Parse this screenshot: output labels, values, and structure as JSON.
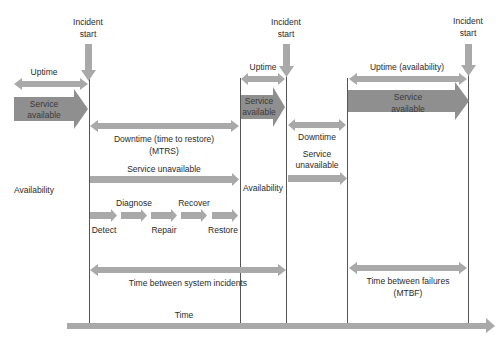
{
  "diagram": {
    "type": "timeline",
    "colors": {
      "arrow_light": "#a9a9a9",
      "arrow_dark": "#8f8f8f",
      "line": "#555555",
      "text": "#2a2a2a"
    },
    "incidents": [
      {
        "label_line1": "Incident",
        "label_line2": "start"
      },
      {
        "label_line1": "Incident",
        "label_line2": "start"
      },
      {
        "label_line1": "Incident",
        "label_line2": "start"
      }
    ],
    "phase1": {
      "uptime": "Uptime",
      "service_available_line1": "Service",
      "service_available_line2": "available",
      "downtime_line1": "Downtime (time to restore)",
      "downtime_line2": "(MTRS)",
      "service_unavailable": "Service unavailable",
      "availability": "Availability",
      "steps": [
        {
          "label": "Detect"
        },
        {
          "label": "Diagnose"
        },
        {
          "label": "Repair"
        },
        {
          "label": "Recover"
        },
        {
          "label": "Restore"
        }
      ]
    },
    "phase2": {
      "uptime": "Uptime",
      "service_available_line1": "Service",
      "service_available_line2": "available",
      "availability": "Availability",
      "downtime": "Downtime",
      "service_unavailable_line1": "Service",
      "service_unavailable_line2": "unavailable"
    },
    "phase3": {
      "uptime": "Uptime (availability)",
      "service_available_line1": "Service",
      "service_available_line2": "available"
    },
    "spans": {
      "time_between_incidents": "Time between system incidents",
      "mtbf_line1": "Time between failures",
      "mtbf_line2": "(MTBF)"
    },
    "time_axis": "Time"
  }
}
